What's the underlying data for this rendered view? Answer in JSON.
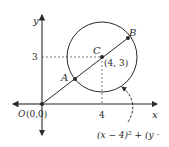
{
  "diagram": {
    "type": "coordinate-geometry",
    "axes": {
      "x_label": "x",
      "y_label": "y",
      "x_tick_label": "4",
      "y_tick_label": "3"
    },
    "points": {
      "origin": {
        "name": "O",
        "coords": "(0,0)"
      },
      "center": {
        "name": "C",
        "coords": "(4, 3)"
      },
      "point_a": {
        "name": "A"
      },
      "point_b": {
        "name": "B"
      }
    },
    "equation_label": "(x − 4)² + (y ·",
    "colors": {
      "line": "#2a2a2a",
      "background": "#ffffff"
    }
  }
}
